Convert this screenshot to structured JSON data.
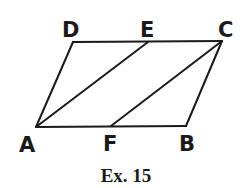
{
  "figure": {
    "caption": "Ex. 15",
    "vertices": {
      "A": {
        "label": "A",
        "x": 36,
        "y": 127
      },
      "F": {
        "label": "F",
        "x": 111,
        "y": 126
      },
      "B": {
        "label": "B",
        "x": 186,
        "y": 126
      },
      "D": {
        "label": "D",
        "x": 73,
        "y": 42
      },
      "E": {
        "label": "E",
        "x": 148,
        "y": 42
      },
      "C": {
        "label": "C",
        "x": 222,
        "y": 41
      }
    },
    "segments": [
      [
        "A",
        "B"
      ],
      [
        "B",
        "C"
      ],
      [
        "C",
        "D"
      ],
      [
        "D",
        "A"
      ],
      [
        "A",
        "E"
      ],
      [
        "F",
        "C"
      ]
    ],
    "stroke_color": "#1a1a1a"
  }
}
